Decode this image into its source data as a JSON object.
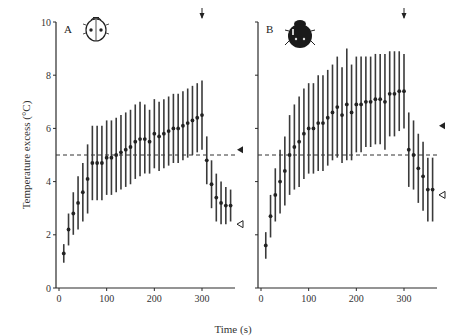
{
  "chart_data": [
    {
      "type": "scatter",
      "panel": "A",
      "title": "",
      "xlabel": "Time (s)",
      "ylabel": "Temperature excess (°C)",
      "xlim": [
        0,
        375
      ],
      "ylim": [
        0,
        10
      ],
      "xticks": [
        0,
        100,
        200,
        300
      ],
      "xtick_labels": [
        "0",
        "100",
        "200",
        "300"
      ],
      "yticks": [
        0,
        2,
        4,
        6,
        8,
        10
      ],
      "ytick_labels": [
        "0",
        "2",
        "4",
        "6",
        "8",
        "10"
      ],
      "grid": false,
      "reference_line_y": 5.0,
      "arrow_at_x": 300,
      "marker_filled_triangle_y": 5.2,
      "marker_open_triangle_y": 2.4,
      "icon": "ladybird-light",
      "series": [
        {
          "name": "mean ± error",
          "x": [
            10,
            20,
            30,
            40,
            50,
            60,
            70,
            80,
            90,
            100,
            110,
            120,
            130,
            140,
            150,
            160,
            170,
            180,
            190,
            200,
            210,
            220,
            230,
            240,
            250,
            260,
            270,
            280,
            290,
            300,
            310,
            320,
            330,
            340,
            350,
            360
          ],
          "y": [
            1.3,
            2.2,
            2.8,
            3.2,
            3.6,
            4.1,
            4.7,
            4.7,
            4.7,
            4.9,
            4.9,
            5.0,
            5.1,
            5.2,
            5.3,
            5.5,
            5.6,
            5.6,
            5.5,
            5.8,
            5.7,
            5.8,
            5.9,
            6.0,
            6.0,
            6.1,
            6.2,
            6.3,
            6.4,
            6.5,
            4.8,
            3.9,
            3.4,
            3.2,
            3.1,
            3.1
          ],
          "err": [
            0.35,
            0.6,
            0.8,
            1.0,
            1.1,
            1.3,
            1.4,
            1.4,
            1.4,
            1.4,
            1.4,
            1.4,
            1.4,
            1.4,
            1.4,
            1.4,
            1.4,
            1.3,
            1.2,
            1.3,
            1.3,
            1.3,
            1.3,
            1.3,
            1.3,
            1.3,
            1.3,
            1.3,
            1.3,
            1.3,
            0.9,
            0.9,
            0.9,
            0.8,
            0.7,
            0.6
          ]
        }
      ]
    },
    {
      "type": "scatter",
      "panel": "B",
      "title": "",
      "xlabel": "Time (s)",
      "ylabel": "",
      "xlim": [
        0,
        375
      ],
      "ylim": [
        0,
        10
      ],
      "xticks": [
        0,
        100,
        200,
        300
      ],
      "xtick_labels": [
        "0",
        "100",
        "200",
        "300"
      ],
      "yticks": [
        0,
        2,
        4,
        6,
        8,
        10
      ],
      "grid": false,
      "reference_line_y": 5.0,
      "arrow_at_x": 300,
      "marker_filled_triangle_y": 6.1,
      "marker_open_triangle_y": 3.5,
      "icon": "ladybird-dark",
      "series": [
        {
          "name": "mean ± error",
          "x": [
            10,
            20,
            30,
            40,
            50,
            60,
            70,
            80,
            90,
            100,
            110,
            120,
            130,
            140,
            150,
            160,
            170,
            180,
            190,
            200,
            210,
            220,
            230,
            240,
            250,
            260,
            270,
            280,
            290,
            300,
            310,
            320,
            330,
            340,
            350,
            360
          ],
          "y": [
            1.6,
            2.7,
            3.5,
            4.0,
            4.4,
            5.0,
            5.3,
            5.5,
            5.8,
            6.0,
            6.0,
            6.2,
            6.2,
            6.4,
            6.6,
            6.8,
            6.5,
            6.9,
            6.6,
            6.9,
            6.9,
            7.0,
            7.0,
            7.1,
            7.1,
            7.0,
            7.3,
            7.3,
            7.4,
            7.4,
            5.2,
            5.0,
            4.5,
            4.2,
            3.7,
            3.7
          ],
          "err": [
            0.5,
            0.8,
            1.0,
            1.2,
            1.3,
            1.5,
            1.6,
            1.7,
            1.7,
            1.7,
            1.7,
            1.8,
            1.8,
            1.8,
            1.8,
            1.9,
            1.8,
            2.1,
            1.8,
            1.8,
            1.8,
            1.7,
            1.7,
            1.7,
            1.7,
            1.8,
            1.6,
            1.6,
            1.5,
            1.4,
            1.4,
            1.3,
            1.3,
            1.3,
            1.2,
            1.2
          ]
        }
      ]
    }
  ],
  "figure": {
    "panel_a_label": "A",
    "panel_b_label": "B",
    "x_axis_label": "Time (s)",
    "y_axis_label": "Temperature excess (°C)",
    "x_tick_labels": [
      "0",
      "100",
      "200",
      "300"
    ],
    "y_tick_labels": [
      "0",
      "2",
      "4",
      "6",
      "8",
      "10"
    ],
    "colors": {
      "ink": "#222222",
      "background": "#ffffff"
    }
  }
}
